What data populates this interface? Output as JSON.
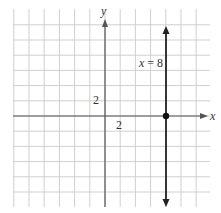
{
  "chart_data": {
    "type": "line",
    "title": "",
    "xlabel": "x",
    "ylabel": "y",
    "x_tick_label": "2",
    "y_tick_label": "2",
    "grid_unit": 2,
    "xlim": [
      -12,
      14
    ],
    "ylim": [
      -12,
      12
    ],
    "grid": true,
    "series": [
      {
        "name": "x = 8",
        "kind": "vertical-line",
        "x": 8,
        "marked_point": [
          8,
          0
        ],
        "arrows": "both"
      }
    ],
    "annotations": [
      {
        "text": "x = 8",
        "x": 6.5,
        "y": 7
      }
    ]
  },
  "labels": {
    "x_axis": "x",
    "y_axis": "y",
    "x_tick": "2",
    "y_tick": "2",
    "line_label": "x = 8"
  },
  "colors": {
    "grid": "#cfcfcf",
    "axis": "#555555",
    "line": "#222222",
    "point": "#111111"
  }
}
